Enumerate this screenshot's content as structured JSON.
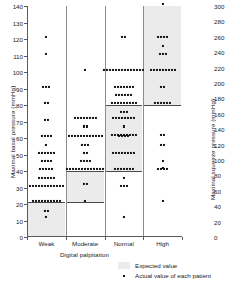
{
  "chart_data": {
    "type": "scatter",
    "title": "",
    "xlabel": "Digital palpitation",
    "ylabel": "Maximal basal pressure (mmHg)",
    "ylabel_right": "Maximal squeeze pressure (mmHg)",
    "categories": [
      "Weak",
      "Moderate",
      "Normal",
      "High"
    ],
    "ylim": [
      0,
      140
    ],
    "yticks": [
      0,
      10,
      20,
      30,
      40,
      50,
      60,
      70,
      80,
      90,
      100,
      110,
      120,
      130,
      140
    ],
    "ylim_right": [
      0,
      300
    ],
    "yticks_right": [
      0,
      20,
      40,
      60,
      80,
      100,
      120,
      140,
      160,
      180,
      200,
      220,
      240,
      260,
      280,
      300
    ],
    "grid": false,
    "legend_position": "bottom-right",
    "legend": [
      {
        "marker": "band",
        "label": "Expected value"
      },
      {
        "marker": "square",
        "label": "Actual value of each patient"
      }
    ],
    "expected_bands": [
      {
        "category": "Weak",
        "low": 0,
        "high": 21
      },
      {
        "category": "Moderate",
        "low": 21,
        "high": 40
      },
      {
        "category": "Normal",
        "low": 40,
        "high": 80
      },
      {
        "category": "High",
        "low": 80,
        "high": 140
      }
    ],
    "series": [
      {
        "name": "Weak",
        "category": "Weak",
        "points": [
          {
            "value": 121,
            "count": 1
          },
          {
            "value": 111,
            "count": 1
          },
          {
            "value": 91,
            "count": 3
          },
          {
            "value": 81,
            "count": 2
          },
          {
            "value": 71,
            "count": 2
          },
          {
            "value": 61,
            "count": 4
          },
          {
            "value": 56,
            "count": 1
          },
          {
            "value": 51,
            "count": 6
          },
          {
            "value": 46,
            "count": 4
          },
          {
            "value": 41,
            "count": 5
          },
          {
            "value": 36,
            "count": 6
          },
          {
            "value": 31,
            "count": 12
          },
          {
            "value": 22,
            "count": 10
          },
          {
            "value": 16,
            "count": 2
          },
          {
            "value": 12,
            "count": 1
          }
        ]
      },
      {
        "name": "Moderate",
        "category": "Moderate",
        "points": [
          {
            "value": 101,
            "count": 1
          },
          {
            "value": 72,
            "count": 8
          },
          {
            "value": 67,
            "count": 2
          },
          {
            "value": 61,
            "count": 12
          },
          {
            "value": 56,
            "count": 3
          },
          {
            "value": 51,
            "count": 2
          },
          {
            "value": 46,
            "count": 4
          },
          {
            "value": 41,
            "count": 13
          },
          {
            "value": 32,
            "count": 2
          },
          {
            "value": 22,
            "count": 1
          }
        ]
      },
      {
        "name": "Normal",
        "category": "Normal",
        "points": [
          {
            "value": 121,
            "count": 2
          },
          {
            "value": 101,
            "count": 14
          },
          {
            "value": 91,
            "count": 7
          },
          {
            "value": 86,
            "count": 6
          },
          {
            "value": 81,
            "count": 9
          },
          {
            "value": 76,
            "count": 3
          },
          {
            "value": 72,
            "count": 8
          },
          {
            "value": 67,
            "count": 1
          },
          {
            "value": 62,
            "count": 9
          },
          {
            "value": 61,
            "count": 4
          },
          {
            "value": 51,
            "count": 8
          },
          {
            "value": 41,
            "count": 7
          },
          {
            "value": 36,
            "count": 1
          },
          {
            "value": 31,
            "count": 3
          },
          {
            "value": 12,
            "count": 1
          }
        ]
      },
      {
        "name": "High",
        "category": "High",
        "points": [
          {
            "value": 141,
            "count": 1
          },
          {
            "value": 121,
            "count": 4
          },
          {
            "value": 116,
            "count": 1
          },
          {
            "value": 111,
            "count": 3
          },
          {
            "value": 101,
            "count": 9
          },
          {
            "value": 91,
            "count": 2
          },
          {
            "value": 81,
            "count": 6
          },
          {
            "value": 62,
            "count": 2
          },
          {
            "value": 56,
            "count": 2
          },
          {
            "value": 46,
            "count": 1
          },
          {
            "value": 42,
            "count": 1
          },
          {
            "value": 41,
            "count": 4
          },
          {
            "value": 22,
            "count": 1
          }
        ]
      }
    ]
  }
}
